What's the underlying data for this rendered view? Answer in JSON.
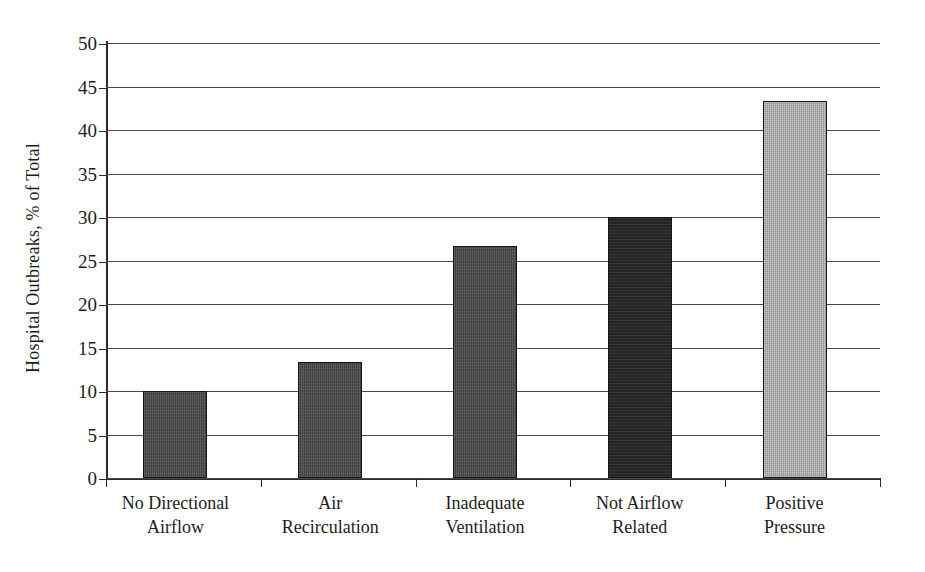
{
  "chart_data": {
    "type": "bar",
    "title": "",
    "xlabel": "",
    "ylabel": "Hospital Outbreaks, % of Total",
    "ylim": [
      0,
      50
    ],
    "ytick_step": 5,
    "yticks": [
      50,
      45,
      40,
      35,
      30,
      25,
      20,
      15,
      10,
      5,
      0
    ],
    "grid": true,
    "legend": "none",
    "categories": [
      "No Directional Airflow",
      "Air Recirculation",
      "Inadequate Ventilation",
      "Not Airflow Related",
      "Positive Pressure"
    ],
    "category_lines": [
      [
        "No Directional",
        "Airflow"
      ],
      [
        "Air",
        "Recirculation"
      ],
      [
        "Inadequate",
        "Ventilation"
      ],
      [
        "Not Airflow",
        "Related"
      ],
      [
        "Positive",
        "Pressure"
      ]
    ],
    "values": [
      10.0,
      13.3,
      26.7,
      30.0,
      43.3
    ],
    "bar_styles": [
      "dark-hatch",
      "dark-hatch",
      "dark-hatch",
      "darkest-solid",
      "light-checker"
    ],
    "colors": {
      "bar_dark": "#3d3d3d",
      "bar_darkest": "#242424",
      "bar_light": "#8d8d8d",
      "bar_edge": "#151515",
      "gridline": "#4a4a4a",
      "axis": "#2b2b2b",
      "text": "#1c1c1c",
      "background": "#ffffff"
    }
  }
}
